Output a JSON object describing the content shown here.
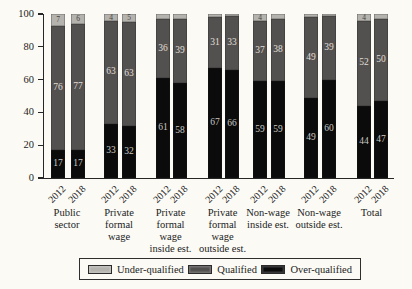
{
  "chart_data": {
    "type": "bar",
    "variant": "stacked-percentage",
    "title": "",
    "ylabel": "Percentage",
    "ylim": [
      0,
      100
    ],
    "yticks": [
      0,
      20,
      40,
      60,
      80,
      100
    ],
    "x_tick_years": [
      "2012",
      "2018"
    ],
    "grid": false,
    "legend": {
      "position": "bottom",
      "items": [
        {
          "key": "under",
          "label": "Under-qualified",
          "color": "#b5b3ae"
        },
        {
          "key": "qualified",
          "label": "Qualified",
          "color": "#53514f"
        },
        {
          "key": "over",
          "label": "Over-qualified",
          "color": "#0b0b0b"
        }
      ]
    },
    "stack_order_bottom_to_top": [
      "over",
      "qualified",
      "under"
    ],
    "groups": [
      {
        "category": "Public sector",
        "category_lines": [
          "Public",
          "sector"
        ],
        "bars": [
          {
            "year": "2012",
            "over": 17,
            "qualified": 76,
            "under": 7,
            "show_labels": {
              "over": true,
              "qualified": true,
              "under": true
            }
          },
          {
            "year": "2018",
            "over": 17,
            "qualified": 77,
            "under": 6,
            "show_labels": {
              "over": true,
              "qualified": true,
              "under": true
            }
          }
        ]
      },
      {
        "category": "Private formal wage",
        "category_lines": [
          "Private",
          "formal",
          "wage"
        ],
        "bars": [
          {
            "year": "2012",
            "over": 33,
            "qualified": 63,
            "under": 4,
            "show_labels": {
              "over": true,
              "qualified": true,
              "under": true
            }
          },
          {
            "year": "2018",
            "over": 32,
            "qualified": 63,
            "under": 5,
            "show_labels": {
              "over": true,
              "qualified": true,
              "under": true
            }
          }
        ]
      },
      {
        "category": "Private formal wage inside est.",
        "category_lines": [
          "Private",
          "formal",
          "wage",
          "inside est."
        ],
        "bars": [
          {
            "year": "2012",
            "over": 61,
            "qualified": 36,
            "under": 3,
            "show_labels": {
              "over": true,
              "qualified": true,
              "under": false
            }
          },
          {
            "year": "2018",
            "over": 58,
            "qualified": 39,
            "under": 3,
            "show_labels": {
              "over": true,
              "qualified": true,
              "under": false
            }
          }
        ]
      },
      {
        "category": "Private formal wage outside est.",
        "category_lines": [
          "Private",
          "formal",
          "wage",
          "outside est."
        ],
        "bars": [
          {
            "year": "2012",
            "over": 67,
            "qualified": 31,
            "under": 2,
            "show_labels": {
              "over": true,
              "qualified": true,
              "under": false
            }
          },
          {
            "year": "2018",
            "over": 66,
            "qualified": 33,
            "under": 1,
            "show_labels": {
              "over": true,
              "qualified": true,
              "under": false
            }
          }
        ]
      },
      {
        "category": "Non-wage inside est.",
        "category_lines": [
          "Non-wage",
          "inside est."
        ],
        "bars": [
          {
            "year": "2012",
            "over": 59,
            "qualified": 37,
            "under": 4,
            "show_labels": {
              "over": true,
              "qualified": true,
              "under": true
            }
          },
          {
            "year": "2018",
            "over": 59,
            "qualified": 38,
            "under": 3,
            "show_labels": {
              "over": true,
              "qualified": true,
              "under": false
            }
          }
        ]
      },
      {
        "category": "Non-wage outside est.",
        "category_lines": [
          "Non-wage",
          "outside est."
        ],
        "bars": [
          {
            "year": "2012",
            "over": 49,
            "qualified": 49,
            "under": 2,
            "show_labels": {
              "over": true,
              "qualified": true,
              "under": false
            }
          },
          {
            "year": "2018",
            "over": 60,
            "qualified": 39,
            "under": 1,
            "show_labels": {
              "over": true,
              "qualified": true,
              "under": false
            }
          }
        ]
      },
      {
        "category": "Total",
        "category_lines": [
          "Total"
        ],
        "bars": [
          {
            "year": "2012",
            "over": 44,
            "qualified": 52,
            "under": 4,
            "show_labels": {
              "over": true,
              "qualified": true,
              "under": true
            }
          },
          {
            "year": "2018",
            "over": 47,
            "qualified": 50,
            "under": 3,
            "show_labels": {
              "over": true,
              "qualified": true,
              "under": false
            }
          }
        ]
      }
    ]
  }
}
